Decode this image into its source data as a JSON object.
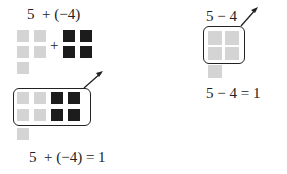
{
  "left": {
    "top_expression": "5  + (−4)",
    "plus_sign": "+",
    "result_equation": "5  + (−4) = 1",
    "positive_tiles": 5,
    "negative_tiles": 4,
    "zero_pairs": 4,
    "colors": {
      "positive": "#d4d4d4",
      "negative": "#1c1c1c"
    }
  },
  "right": {
    "top_expression": "5 − 4",
    "result_equation": "5 − 4 = 1",
    "tiles_total": 5,
    "tiles_removed": 4,
    "colors": {
      "tile": "#d4d4d4"
    }
  }
}
